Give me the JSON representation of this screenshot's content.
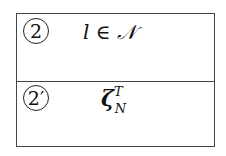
{
  "rows": [
    {
      "label": "2",
      "expression": "l ∈ 𝒩"
    },
    {
      "label": "2′",
      "symbol": "ζ",
      "superscript": "T",
      "subscript": "N"
    }
  ]
}
